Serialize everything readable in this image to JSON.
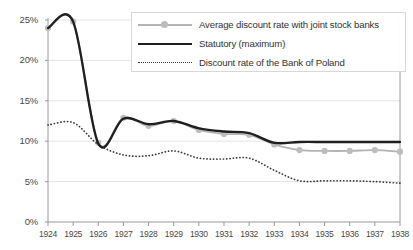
{
  "chart_data": {
    "type": "line",
    "title": "",
    "xlabel": "",
    "ylabel": "",
    "ylim": [
      0,
      25
    ],
    "yticks": [
      "0%",
      "5%",
      "10%",
      "15%",
      "20%",
      "25%"
    ],
    "ytick_values": [
      0,
      5,
      10,
      15,
      20,
      25
    ],
    "grid": true,
    "legend_position": "top-right",
    "categories": [
      "1924",
      "1925",
      "1926",
      "1927",
      "1928",
      "1929",
      "1930",
      "1931",
      "1932",
      "1933",
      "1934",
      "1935",
      "1936",
      "1937",
      "1938"
    ],
    "x": [
      1924,
      1925,
      1926,
      1927,
      1928,
      1929,
      1930,
      1931,
      1932,
      1933,
      1934,
      1935,
      1936,
      1937,
      1938
    ],
    "series": [
      {
        "name": "Average discount rate with joint stock banks",
        "color": "#b3b3b3",
        "style": "line-markers",
        "values": [
          24.0,
          24.8,
          9.8,
          12.9,
          11.9,
          12.5,
          11.4,
          10.9,
          10.8,
          9.6,
          8.9,
          8.8,
          8.8,
          8.9,
          8.7
        ]
      },
      {
        "name": "Statutory (maximum)",
        "color": "#1f1f1f",
        "style": "solid",
        "values": [
          24.0,
          24.8,
          9.7,
          12.8,
          12.1,
          12.5,
          11.6,
          11.2,
          11.0,
          9.8,
          9.9,
          9.9,
          9.9,
          9.9,
          9.9
        ]
      },
      {
        "name": "Discount rate of the Bank of Poland",
        "color": "#3a3a3a",
        "style": "dotted",
        "values": [
          12.0,
          12.3,
          9.6,
          8.3,
          8.2,
          8.8,
          7.9,
          7.8,
          7.9,
          6.4,
          5.1,
          5.1,
          5.1,
          5.0,
          4.8
        ]
      }
    ]
  }
}
